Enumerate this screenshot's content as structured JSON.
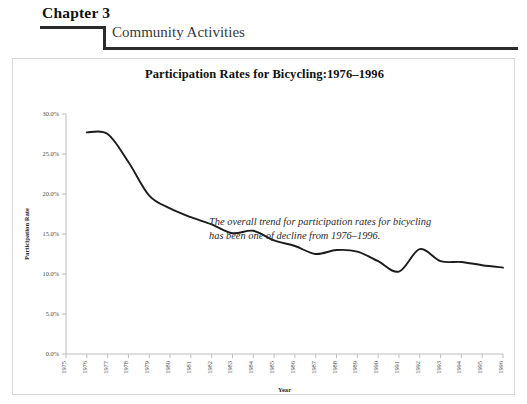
{
  "header": {
    "chapter_label": "Chapter 3",
    "section_label": "Community Activities"
  },
  "figure": {
    "title": "Participation Rates for Bicycling:1976–1996",
    "annotation": "The overall trend for participation rates for bicycling has been one of decline from 1976–1996."
  },
  "chart_data": {
    "type": "line",
    "title": "Participation Rates for Bicycling:1976–1996",
    "xlabel": "Year",
    "ylabel": "Participation Rate",
    "grid": false,
    "legend": false,
    "xlim": [
      1975,
      1996
    ],
    "ylim": [
      0,
      30
    ],
    "ytick_labels": [
      "0.0%",
      "5.0%",
      "10.0%",
      "15.0%",
      "20.0%",
      "25.0%",
      "30.0%"
    ],
    "ytick_values": [
      0,
      5,
      10,
      15,
      20,
      25,
      30
    ],
    "xtick_labels": [
      "1975",
      "1976",
      "1977",
      "1978",
      "1979",
      "1980",
      "1981",
      "1982",
      "1983",
      "1984",
      "1985",
      "1986",
      "1987",
      "1988",
      "1989",
      "1990",
      "1991",
      "1992",
      "1993",
      "1994",
      "1995",
      "1996"
    ],
    "x": [
      1976,
      1977,
      1978,
      1979,
      1980,
      1981,
      1982,
      1983,
      1984,
      1985,
      1986,
      1987,
      1988,
      1989,
      1990,
      1991,
      1992,
      1993,
      1994,
      1995,
      1996
    ],
    "values": [
      27.7,
      27.5,
      24.0,
      19.8,
      18.2,
      17.1,
      16.2,
      15.1,
      15.4,
      14.2,
      13.5,
      12.5,
      13.0,
      12.8,
      11.6,
      10.3,
      13.1,
      11.6,
      11.5,
      11.1,
      10.8
    ],
    "series_name": "Participation Rate",
    "line_color": "#1c1c1c",
    "annotation": "The overall trend for participation rates for bicycling has been one of decline from 1976–1996."
  }
}
